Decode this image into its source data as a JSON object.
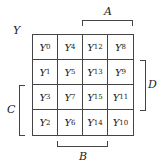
{
  "diagram": {
    "type": "karnaugh-map",
    "output_label": "Y",
    "cells": [
      [
        {
          "base": "Y",
          "sub": "0"
        },
        {
          "base": "Y",
          "sub": "4"
        },
        {
          "base": "Y",
          "sub": "12"
        },
        {
          "base": "Y",
          "sub": "8"
        }
      ],
      [
        {
          "base": "Y",
          "sub": "1"
        },
        {
          "base": "Y",
          "sub": "5"
        },
        {
          "base": "Y",
          "sub": "13"
        },
        {
          "base": "Y",
          "sub": "9"
        }
      ],
      [
        {
          "base": "Y",
          "sub": "3"
        },
        {
          "base": "Y",
          "sub": "7"
        },
        {
          "base": "Y",
          "sub": "15"
        },
        {
          "base": "Y",
          "sub": "11"
        }
      ],
      [
        {
          "base": "Y",
          "sub": "2"
        },
        {
          "base": "Y",
          "sub": "6"
        },
        {
          "base": "Y",
          "sub": "14"
        },
        {
          "base": "Y",
          "sub": "10"
        }
      ]
    ],
    "brackets": {
      "A": {
        "label": "A",
        "side": "top",
        "span": "columns 3-4"
      },
      "B": {
        "label": "B",
        "side": "bottom",
        "span": "columns 2-3"
      },
      "C": {
        "label": "C",
        "side": "left",
        "span": "rows 3-4"
      },
      "D": {
        "label": "D",
        "side": "right",
        "span": "rows 2-3"
      }
    }
  }
}
